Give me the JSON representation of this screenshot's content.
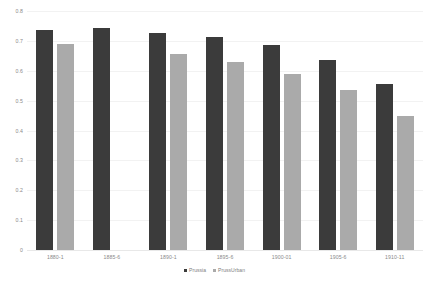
{
  "chart_data": {
    "type": "bar",
    "title": "",
    "subtitle": "",
    "xlabel": "",
    "ylabel": "",
    "categories": [
      "1880-1",
      "1885-6",
      "1890-1",
      "1895-6",
      "1900-01",
      "1905-6",
      "1910-11"
    ],
    "series": [
      {
        "name": "Prussia",
        "color": "#3b3b3b",
        "values": [
          0.735,
          0.742,
          0.725,
          0.712,
          0.685,
          0.635,
          0.555
        ]
      },
      {
        "name": "PrussUrban",
        "color": "#aaaaaa",
        "values": [
          0.688,
          null,
          0.655,
          0.628,
          0.588,
          0.537,
          0.448
        ]
      }
    ],
    "ylim": [
      0,
      0.8
    ],
    "ytick_values": [
      0.8,
      0.7,
      0.6,
      0.5,
      0.4,
      0.3,
      0.2,
      0.1,
      0
    ],
    "ytick_labels": [
      "0.8",
      "0.7",
      "0.6",
      "0.5",
      "0.4",
      "0.3",
      "0.2",
      "0.1",
      "0"
    ],
    "grid": true,
    "grid_color": "#f2f2f2",
    "legend_position": "bottom",
    "background": "#ffffff",
    "annotations": []
  },
  "axes": {
    "y_ticks": [
      {
        "label": "0.8",
        "value": 0.8
      },
      {
        "label": "0.7",
        "value": 0.7
      },
      {
        "label": "0.6",
        "value": 0.6
      },
      {
        "label": "0.5",
        "value": 0.5
      },
      {
        "label": "0.4",
        "value": 0.4
      },
      {
        "label": "0.3",
        "value": 0.3
      },
      {
        "label": "0.2",
        "value": 0.2
      },
      {
        "label": "0.1",
        "value": 0.1
      },
      {
        "label": "0",
        "value": 0
      }
    ]
  },
  "legend": {
    "entries": [
      {
        "label": "Prussia",
        "color": "#3b3b3b",
        "marker": "square-swatch"
      },
      {
        "label": "PrussUrban",
        "color": "#aaaaaa",
        "marker": "square-swatch"
      }
    ]
  }
}
